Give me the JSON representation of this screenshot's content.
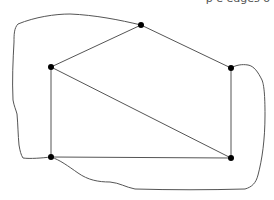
{
  "caption": {
    "text": "                                    p                 e          edges o",
    "clipped": true
  },
  "graph": {
    "vertices": [
      {
        "id": "v-top",
        "x": 141,
        "y": 25
      },
      {
        "id": "v-left",
        "x": 51,
        "y": 67
      },
      {
        "id": "v-right",
        "x": 231,
        "y": 68
      },
      {
        "id": "v-bottom-left",
        "x": 51,
        "y": 157
      },
      {
        "id": "v-bottom-right",
        "x": 231,
        "y": 158
      }
    ],
    "edges": [
      {
        "from": "v-left",
        "to": "v-top"
      },
      {
        "from": "v-top",
        "to": "v-right"
      },
      {
        "from": "v-right",
        "to": "v-bottom-right"
      },
      {
        "from": "v-bottom-left",
        "to": "v-bottom-right"
      },
      {
        "from": "v-left",
        "to": "v-bottom-left"
      },
      {
        "from": "v-left",
        "to": "v-bottom-right"
      }
    ],
    "outline": {
      "description": "hand-drawn closed curve enclosing the graph",
      "stroke_color": "#555555"
    },
    "vertex_color": "#000000",
    "edge_color": "#555555"
  }
}
